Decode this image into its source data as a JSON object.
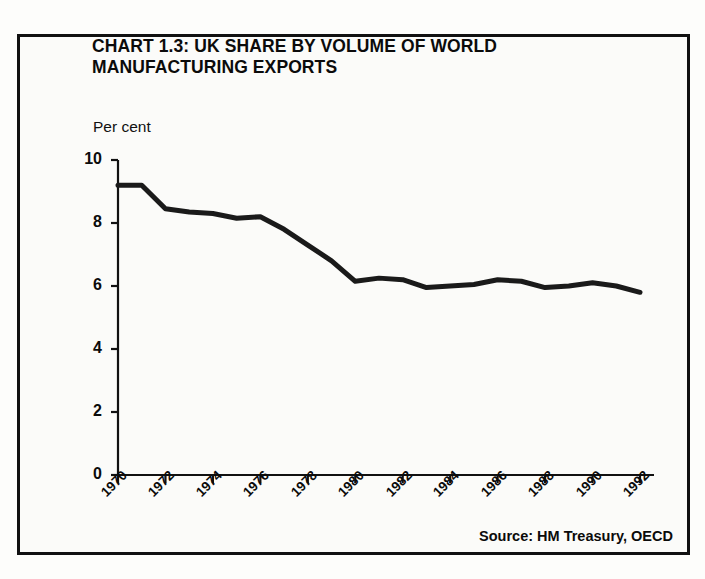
{
  "figure": {
    "title_lines": [
      "CHART 1.3: UK SHARE BY VOLUME OF WORLD",
      "MANUFACTURING EXPORTS"
    ],
    "unit_label": "Per cent",
    "source": "Source: HM Treasury, OECD",
    "line_color": "#1a1a1a",
    "frame_color": "#111111",
    "background": "#fbfbf9"
  },
  "chart_data": {
    "type": "line",
    "title": "CHART 1.3: UK SHARE BY VOLUME OF WORLD MANUFACTURING EXPORTS",
    "subtitle": "Per cent",
    "xlabel": "",
    "ylabel": "Per cent",
    "source": "Source: HM Treasury, OECD",
    "grid": false,
    "legend": "none",
    "xlim": [
      1970,
      1992
    ],
    "ylim": [
      0,
      10
    ],
    "yticks": [
      0,
      2,
      4,
      6,
      8,
      10
    ],
    "ytick_labels": [
      "0",
      "2",
      "4",
      "6",
      "8",
      "10"
    ],
    "xticks": [
      1970,
      1972,
      1974,
      1976,
      1978,
      1980,
      1982,
      1984,
      1986,
      1988,
      1990,
      1992
    ],
    "xtick_labels": [
      "1970",
      "1972",
      "1974",
      "1976",
      "1978",
      "1980",
      "1982",
      "1984",
      "1986",
      "1988",
      "1990",
      "1992"
    ],
    "x": [
      1970,
      1971,
      1972,
      1973,
      1974,
      1975,
      1976,
      1977,
      1978,
      1979,
      1980,
      1981,
      1982,
      1983,
      1984,
      1985,
      1986,
      1987,
      1988,
      1989,
      1990,
      1991,
      1992
    ],
    "series": [
      {
        "name": "UK share of world manufacturing exports",
        "values": [
          9.2,
          9.2,
          8.45,
          8.35,
          8.3,
          8.15,
          8.2,
          7.8,
          7.3,
          6.8,
          6.15,
          6.25,
          6.2,
          5.95,
          6.0,
          6.05,
          6.2,
          6.15,
          5.95,
          6.0,
          6.1,
          6.0,
          5.8
        ]
      }
    ]
  }
}
